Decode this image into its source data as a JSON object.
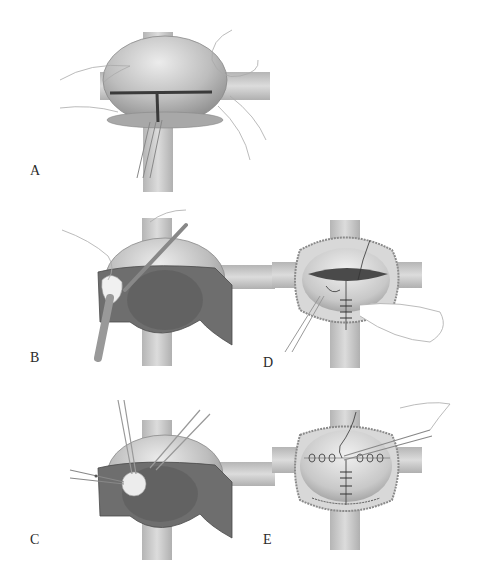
{
  "figure": {
    "type": "surgical-illustration",
    "panels": [
      {
        "id": "A",
        "label": "A",
        "depiction": "bladder with T-shaped incision, hands retracting, forceps"
      },
      {
        "id": "B",
        "label": "B",
        "depiction": "bladder with drapes, sponge stick dissection"
      },
      {
        "id": "C",
        "label": "C",
        "depiction": "bladder with drapes, scissors and forceps dissection"
      },
      {
        "id": "D",
        "label": "D",
        "depiction": "bladder with opened incision and vertical sutures, finger retraction"
      },
      {
        "id": "E",
        "label": "E",
        "depiction": "bladder with horizontal and vertical suture lines, needle holder"
      }
    ],
    "colors": {
      "bladder": "#b8b8b8",
      "bladder_highlight": "#e6e6e6",
      "drape": "#6e6e6e",
      "post": "#c9c9c9",
      "incision": "#3a3a3a",
      "outline": "#9a9a9a",
      "label": "#2a2a2a"
    }
  }
}
